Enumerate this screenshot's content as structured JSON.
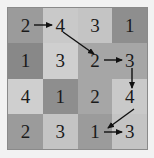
{
  "figure": {
    "kind": "numeric-grid-with-arrows",
    "background_color": "#f2f2f2",
    "border_color": "#8a8a8a",
    "text_color": "#1a1a1a",
    "arrow_color": "#111111"
  },
  "grid": {
    "rows": 4,
    "columns": 4,
    "cells": [
      {
        "value": "2",
        "shade": "#9b9b9b"
      },
      {
        "value": "4",
        "shade": "#c9c9c9"
      },
      {
        "value": "3",
        "shade": "#c4c4c4"
      },
      {
        "value": "1",
        "shade": "#8e8e8e"
      },
      {
        "value": "1",
        "shade": "#888888"
      },
      {
        "value": "3",
        "shade": "#cfcfcf"
      },
      {
        "value": "2",
        "shade": "#a6a6a6"
      },
      {
        "value": "3",
        "shade": "#a6a6a6"
      },
      {
        "value": "4",
        "shade": "#cfcfcf"
      },
      {
        "value": "1",
        "shade": "#8e8e8e"
      },
      {
        "value": "2",
        "shade": "#a6a6a6"
      },
      {
        "value": "4",
        "shade": "#c9c9c9"
      },
      {
        "value": "2",
        "shade": "#9b9b9b"
      },
      {
        "value": "3",
        "shade": "#c4c4c4"
      },
      {
        "value": "1",
        "shade": "#9b9b9b"
      },
      {
        "value": "3",
        "shade": "#c4c4c4"
      }
    ]
  },
  "arrows": [
    {
      "name": "arrow-r1c1-to-r1c2",
      "from_cell": "r1c1",
      "to_cell": "r1c2",
      "from_value": "2",
      "to_value": "4",
      "direction": "right",
      "x1": 26,
      "y1": 17,
      "x2": 44,
      "y2": 17
    },
    {
      "name": "arrow-r1c2-to-r2c3",
      "from_cell": "r1c2",
      "to_cell": "r2c3",
      "from_value": "4",
      "to_value": "2",
      "direction": "down-right",
      "x1": 55,
      "y1": 24,
      "x2": 86,
      "y2": 46
    },
    {
      "name": "arrow-r2c3-to-r2c4",
      "from_cell": "r2c3",
      "to_cell": "r2c4",
      "from_value": "2",
      "to_value": "3",
      "direction": "right",
      "x1": 96,
      "y1": 52,
      "x2": 114,
      "y2": 52
    },
    {
      "name": "arrow-r2c4-to-r3c4",
      "from_cell": "r2c4",
      "to_cell": "r3c4",
      "from_value": "3",
      "to_value": "4",
      "direction": "down",
      "x1": 124,
      "y1": 60,
      "x2": 124,
      "y2": 80
    },
    {
      "name": "arrow-r3c4-to-r4c3",
      "from_cell": "r3c4",
      "to_cell": "r4c3",
      "from_value": "4",
      "to_value": "1",
      "direction": "down-left",
      "x1": 126,
      "y1": 101,
      "x2": 100,
      "y2": 120
    },
    {
      "name": "arrow-r4c3-to-r4c4",
      "from_cell": "r4c3",
      "to_cell": "r4c4",
      "from_value": "1",
      "to_value": "3",
      "direction": "right",
      "x1": 96,
      "y1": 124,
      "x2": 114,
      "y2": 124
    }
  ]
}
